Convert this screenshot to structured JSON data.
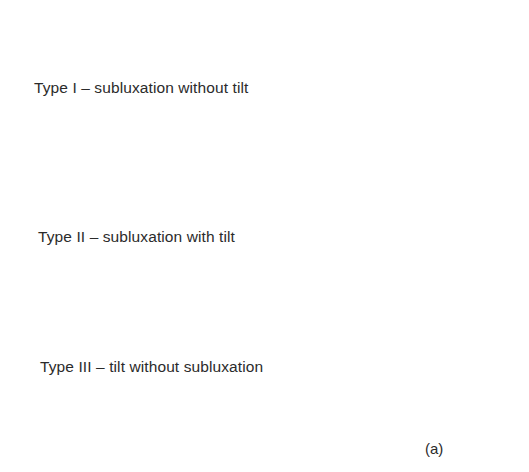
{
  "figure": {
    "caption": "(a)",
    "types": [
      {
        "id": "type-1",
        "label": "Type I – subluxation without tilt",
        "diagram": {
          "lateral_label": "L",
          "medial_label": "M",
          "has_baseline": false
        }
      },
      {
        "id": "type-2",
        "label": "Type II – subluxation with tilt",
        "diagram": {
          "lateral_label": "L",
          "medial_label": "M",
          "has_baseline": true
        }
      },
      {
        "id": "type-3",
        "label": "Type III – tilt without subluxation",
        "diagram": {
          "lateral_label": "L",
          "medial_label": "M",
          "has_baseline": true
        }
      }
    ]
  },
  "colors": {
    "background": "#ffffff",
    "ink": "#2a2a2a"
  }
}
